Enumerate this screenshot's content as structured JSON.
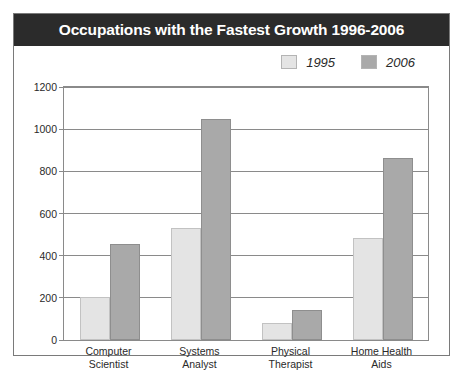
{
  "title": "Occupations with the Fastest Growth 1996-2006",
  "legend": {
    "position": "top-right",
    "entries": [
      {
        "label": "1995",
        "color": "#e4e4e4"
      },
      {
        "label": "2006",
        "color": "#a9a9a9"
      }
    ]
  },
  "chart_data": {
    "type": "bar",
    "title": "Occupations with the Fastest Growth 1996-2006",
    "xlabel": "",
    "ylabel": "",
    "ylim": [
      0,
      1200
    ],
    "yticks": [
      0,
      200,
      400,
      600,
      800,
      1000,
      1200
    ],
    "ytick_labels": [
      "0",
      "200",
      "400",
      "600",
      "800",
      "1000",
      "1200"
    ],
    "grid": true,
    "legend_position": "top-right",
    "categories": [
      "Computer Scientist",
      "Systems Analyst",
      "Physical Therapist",
      "Home Health Aids"
    ],
    "category_lines": [
      [
        "Computer",
        "Scientist"
      ],
      [
        "Systems",
        "Analyst"
      ],
      [
        "Physical",
        "Therapist"
      ],
      [
        "Home Health",
        "Aids"
      ]
    ],
    "series": [
      {
        "name": "1995",
        "color": "#e4e4e4",
        "values": [
          205,
          530,
          80,
          485
        ]
      },
      {
        "name": "2006",
        "color": "#a9a9a9",
        "values": [
          455,
          1050,
          140,
          865
        ]
      }
    ]
  }
}
